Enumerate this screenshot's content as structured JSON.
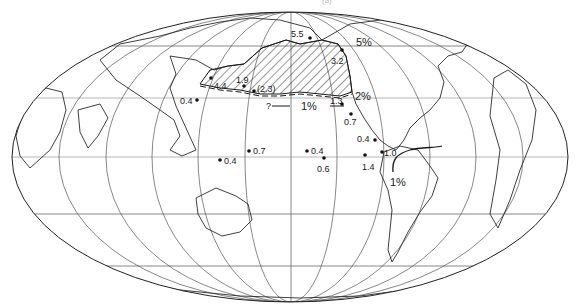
{
  "figure": {
    "panel_label": "(a)",
    "projection": "Mollweide (Pacific-centered)",
    "colors": {
      "ink": "#1a1a1a",
      "grid": "#444444",
      "coast": "#2a2a2a",
      "background": "#ffffff"
    }
  },
  "contours": [
    {
      "label": "5%",
      "x": 356,
      "y": 42
    },
    {
      "label": "2%",
      "x": 357,
      "y": 96
    },
    {
      "label": "1%",
      "x": 305,
      "y": 108
    },
    {
      "label": "?",
      "x": 268,
      "y": 108
    },
    {
      "label": "1%",
      "x": 393,
      "y": 180
    }
  ],
  "stations": [
    {
      "value": "5.5",
      "dot": [
        310,
        38
      ],
      "text": [
        294,
        36
      ]
    },
    {
      "value": "3.2",
      "dot": [
        342,
        50
      ],
      "text": [
        340,
        63
      ]
    },
    {
      "value": "4.4",
      "dot": [
        211,
        78
      ],
      "text": [
        215,
        86
      ]
    },
    {
      "value": "1.9",
      "dot": [
        244,
        86
      ],
      "text": [
        238,
        80
      ]
    },
    {
      "value": "(2.3)",
      "dot": [
        254,
        91
      ],
      "text": [
        258,
        90
      ]
    },
    {
      "value": "0.4",
      "dot": [
        197,
        100
      ],
      "text": [
        181,
        104
      ]
    },
    {
      "value": "1.3",
      "dot": [
        342,
        104
      ],
      "text": [
        330,
        104
      ]
    },
    {
      "value": "0.7",
      "dot": [
        351,
        114
      ],
      "text": [
        344,
        124
      ]
    },
    {
      "value": "0.4",
      "dot": [
        375,
        140
      ],
      "text": [
        357,
        141
      ]
    },
    {
      "value": "0.7",
      "dot": [
        249,
        151
      ],
      "text": [
        253,
        155
      ]
    },
    {
      "value": "0.4",
      "dot": [
        307,
        151
      ],
      "text": [
        311,
        155
      ]
    },
    {
      "value": "0.6",
      "dot": [
        324,
        158
      ],
      "text": [
        316,
        171
      ]
    },
    {
      "value": "1.4",
      "dot": [
        365,
        155
      ],
      "text": [
        362,
        170
      ]
    },
    {
      "value": "1.0",
      "dot": [
        382,
        152
      ],
      "text": [
        384,
        157
      ]
    },
    {
      "value": "0.4",
      "dot": [
        220,
        160
      ],
      "text": [
        224,
        164
      ]
    }
  ]
}
